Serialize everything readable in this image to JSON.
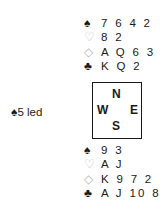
{
  "north": {
    "spades": "7 6 4 2",
    "hearts": "8 2",
    "diamonds": "A Q 6 3",
    "clubs": "K Q 2"
  },
  "south": {
    "spades": "9 3",
    "hearts": "A J",
    "diamonds": "K 9 7 2",
    "clubs": "A J 10 8 6"
  },
  "compass": {
    "n": "N",
    "w": "W",
    "e": "E",
    "s": "S"
  },
  "lead": {
    "suit": "♠",
    "text": "5 led"
  },
  "suits": {
    "spade": "♠",
    "heart": "♡",
    "diamond": "◇",
    "club": "♣"
  }
}
